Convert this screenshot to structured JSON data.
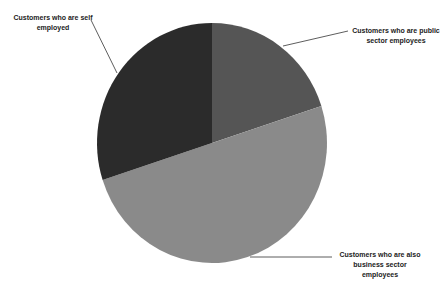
{
  "chart_data": {
    "type": "pie",
    "title": "",
    "start_angle_deg": 0,
    "direction": "clockwise",
    "slices": [
      {
        "label": "Customers who are public sector employees",
        "value": 20,
        "color": "#555555"
      },
      {
        "label": "Customers who are also business sector employees",
        "value": 50,
        "color": "#8a8a8a"
      },
      {
        "label": "Customers who are self employed",
        "value": 30,
        "color": "#2b2b2b"
      }
    ],
    "legend": "none",
    "data_labels": "category name with leader lines"
  },
  "labels": {
    "public_line1": "Customers who are public",
    "public_line2": "sector employees",
    "business_line1": "Customers who are also",
    "business_line2": "business sector",
    "business_line3": "employees",
    "self_line1": "Customers who are self",
    "self_line2": "employed"
  }
}
